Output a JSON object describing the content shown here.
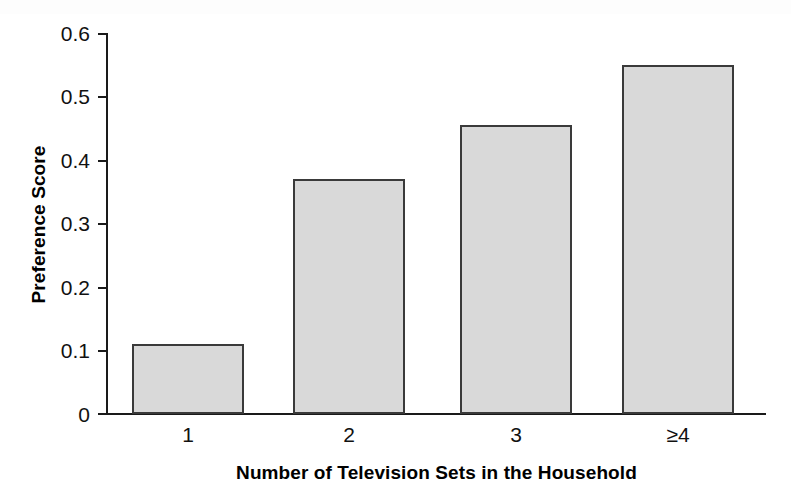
{
  "chart_data": {
    "type": "bar",
    "title": "",
    "subtitle": "",
    "xlabel": "Number of Television Sets in the Household",
    "ylabel": "Preference Score",
    "categories": [
      "1",
      "2",
      "3",
      "≥4"
    ],
    "values": [
      0.11,
      0.37,
      0.455,
      0.55
    ],
    "series": [
      {
        "name": "Preference Score",
        "values": [
          0.11,
          0.37,
          0.455,
          0.55
        ]
      }
    ],
    "ylim": [
      0,
      0.6
    ],
    "ytick_values": [
      0,
      0.1,
      0.2,
      0.3,
      0.4,
      0.5,
      0.6
    ],
    "ytick_labels": [
      "0",
      "0.1",
      "0.2",
      "0.3",
      "0.4",
      "0.5",
      "0.6"
    ],
    "grid": false,
    "legend": false,
    "legend_position": "none",
    "bar_fill_color": "#d9d9d9",
    "bar_edge_color": "#3a3a3a",
    "axis_color": "#1a1a1a",
    "background_color": "#ffffff"
  }
}
